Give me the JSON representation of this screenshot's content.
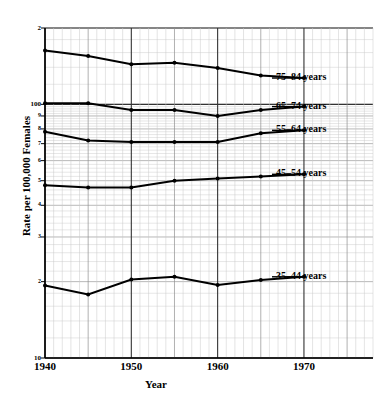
{
  "chart_data": {
    "type": "line",
    "title": "",
    "xlabel": "Year",
    "ylabel": "Rate per 100,000 Females",
    "yscale": "log",
    "ylim": [
      10,
      200
    ],
    "xlim": [
      1940,
      1978
    ],
    "grid": true,
    "legend_position": "inline-right",
    "x": [
      1940,
      1945,
      1950,
      1955,
      1960,
      1965,
      1970
    ],
    "xticks": [
      "1940",
      "1950",
      "1960",
      "1970"
    ],
    "xtick_values": [
      1940,
      1950,
      1960,
      1970
    ],
    "yticks": [
      "2",
      "100",
      "9",
      "8",
      "7",
      "6",
      "5",
      "4",
      "3",
      "2",
      "10"
    ],
    "ytick_values": [
      200,
      100,
      90,
      80,
      70,
      60,
      50,
      40,
      30,
      20,
      10
    ],
    "series": [
      {
        "name": "75-84 years",
        "label": "75–84 years",
        "values": [
          163,
          155,
          144,
          146,
          139,
          130,
          127
        ]
      },
      {
        "name": "65-74 years",
        "label": "65–74 years",
        "values": [
          101,
          101,
          95,
          95,
          90,
          95,
          98
        ]
      },
      {
        "name": "55-64 years",
        "label": "55–64 years",
        "values": [
          78,
          72,
          71,
          71,
          71,
          77,
          79
        ]
      },
      {
        "name": "45-54 years",
        "label": "45–54 years",
        "values": [
          48,
          47,
          47,
          50,
          51,
          52,
          53
        ]
      },
      {
        "name": "35-44 years",
        "label": "35–44 years",
        "values": [
          19.3,
          17.8,
          20.4,
          20.9,
          19.4,
          20.3,
          20.9
        ]
      }
    ]
  }
}
